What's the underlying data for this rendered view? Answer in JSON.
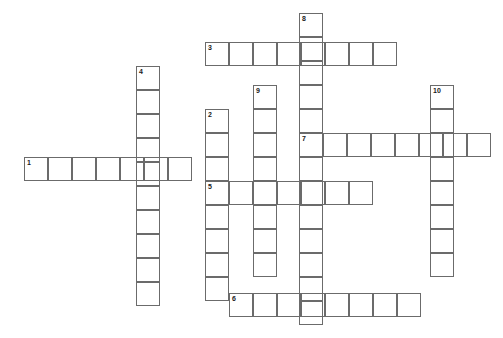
{
  "puzzle": {
    "title": "Crossword Puzzle Grid",
    "cell_size": 24,
    "canvas_width": 503,
    "canvas_height": 338,
    "background_color": "#ffffff",
    "cell_border_color": "#6b6b6b",
    "number_color": "#1a1a1a",
    "entries": [
      {
        "number": "1",
        "direction": "across",
        "x": 24,
        "y": 157,
        "length": 7,
        "letters": [
          "",
          "",
          "",
          "",
          "",
          "",
          ""
        ]
      },
      {
        "number": "2",
        "direction": "down",
        "x": 205,
        "y": 109,
        "length": 8,
        "letters": [
          "",
          "",
          "",
          "",
          "",
          "",
          "",
          ""
        ]
      },
      {
        "number": "3",
        "direction": "across",
        "x": 205,
        "y": 42,
        "length": 8,
        "letters": [
          "",
          "",
          "",
          "",
          "",
          "",
          "",
          ""
        ]
      },
      {
        "number": "4",
        "direction": "down",
        "x": 136,
        "y": 66,
        "length": 10,
        "letters": [
          "",
          "",
          "",
          "",
          "",
          "",
          "",
          "",
          "",
          ""
        ]
      },
      {
        "number": "5",
        "direction": "across",
        "x": 205,
        "y": 181,
        "length": 7,
        "letters": [
          "",
          "",
          "",
          "",
          "",
          "",
          ""
        ]
      },
      {
        "number": "6",
        "direction": "across",
        "x": 229,
        "y": 293,
        "length": 8,
        "letters": [
          "",
          "",
          "",
          "",
          "",
          "",
          "",
          ""
        ]
      },
      {
        "number": "7",
        "direction": "across",
        "x": 299,
        "y": 133,
        "length": 8,
        "letters": [
          "",
          "",
          "",
          "",
          "",
          "",
          "",
          ""
        ]
      },
      {
        "number": "8",
        "direction": "down",
        "x": 299,
        "y": 13,
        "length": 13,
        "letters": [
          "",
          "",
          "",
          "",
          "",
          "",
          "",
          "",
          "",
          "",
          "",
          "",
          ""
        ]
      },
      {
        "number": "9",
        "direction": "down",
        "x": 253,
        "y": 85,
        "length": 8,
        "letters": [
          "",
          "",
          "",
          "",
          "",
          "",
          "",
          ""
        ]
      },
      {
        "number": "10",
        "direction": "down",
        "x": 430,
        "y": 85,
        "length": 8,
        "letters": [
          "",
          "",
          "",
          "",
          "",
          "",
          "",
          ""
        ]
      }
    ]
  }
}
